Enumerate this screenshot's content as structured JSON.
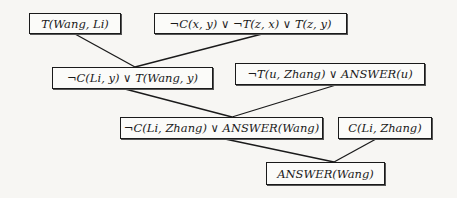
{
  "diagram": {
    "type": "resolution-refutation-tree",
    "nodes": [
      {
        "id": "n1",
        "label": "T(Wang, Li)",
        "x": 29,
        "y": 13,
        "w": 92,
        "h": 21
      },
      {
        "id": "n2",
        "label": "¬C(x, y) ∨ ¬T(z, x) ∨ T(z, y)",
        "x": 154,
        "y": 13,
        "w": 193,
        "h": 21
      },
      {
        "id": "n3",
        "label": "¬C(Li, y) ∨ T(Wang, y)",
        "x": 52,
        "y": 67,
        "w": 161,
        "h": 22
      },
      {
        "id": "n4",
        "label": "¬T(u, Zhang) ∨ ANSWER(u)",
        "x": 235,
        "y": 63,
        "w": 190,
        "h": 22
      },
      {
        "id": "n5",
        "label": "¬C(Li, Zhang) ∨ ANSWER(Wang)",
        "x": 120,
        "y": 117,
        "w": 203,
        "h": 22
      },
      {
        "id": "n6",
        "label": "C(Li, Zhang)",
        "x": 338,
        "y": 117,
        "w": 94,
        "h": 22
      },
      {
        "id": "n7",
        "label": "ANSWER(Wang)",
        "x": 266,
        "y": 162,
        "w": 119,
        "h": 23
      }
    ],
    "edges": [
      {
        "from": "n1",
        "to": "n3",
        "x1": 75,
        "y1": 34,
        "x2": 135,
        "y2": 67
      },
      {
        "from": "n2",
        "to": "n3",
        "x1": 262,
        "y1": 34,
        "x2": 135,
        "y2": 67
      },
      {
        "from": "n3",
        "to": "n5",
        "x1": 125,
        "y1": 89,
        "x2": 232,
        "y2": 117
      },
      {
        "from": "n4",
        "to": "n5",
        "x1": 336,
        "y1": 85,
        "x2": 232,
        "y2": 117
      },
      {
        "from": "n5",
        "to": "n7",
        "x1": 225,
        "y1": 139,
        "x2": 334,
        "y2": 162
      },
      {
        "from": "n6",
        "to": "n7",
        "x1": 376,
        "y1": 139,
        "x2": 334,
        "y2": 162
      }
    ],
    "colors": {
      "line": "#1a1a1a",
      "background": "#f7f6f3"
    }
  }
}
